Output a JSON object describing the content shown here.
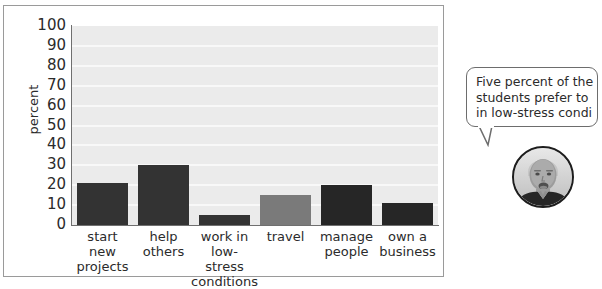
{
  "chart_data": {
    "type": "bar",
    "title": "",
    "xlabel": "",
    "ylabel": "percent",
    "ylim": [
      0,
      100
    ],
    "ytick_step": 10,
    "yticks": [
      100,
      90,
      80,
      70,
      60,
      50,
      40,
      30,
      20,
      10,
      0
    ],
    "grid": true,
    "legend": "none",
    "categories": [
      "start\nnew\nprojects",
      "help\nothers",
      "work in low-\nstress\nconditions",
      "travel",
      "manage\npeople",
      "own a\nbusiness"
    ],
    "values": [
      21,
      30,
      5,
      15,
      20,
      11
    ],
    "bar_colors": [
      "#333333",
      "#333333",
      "#333333",
      "#7a7a7a",
      "#262626",
      "#262626"
    ],
    "plot_background": "#ebebeb",
    "gridline_color": "#f8f8f8",
    "axis_color": "#6f6f6f"
  },
  "annotation": {
    "bubble_text": "Five percent of the\nstudents prefer to\nin low-stress condi",
    "avatar_alt": "person-photo"
  },
  "colors": {
    "page_background": "#ffffff",
    "frame_border": "#9a9a9a",
    "text": "#2b2b2b",
    "bubble_border": "#6d6d6d"
  }
}
